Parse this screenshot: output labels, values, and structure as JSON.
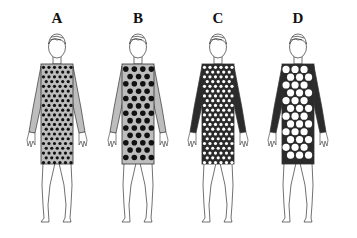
{
  "figures": [
    {
      "label": "A",
      "sleeve_color": "#bdbdbd",
      "dress_color": "#bdbdbd",
      "dot_color": "#111111",
      "dot_size": "small",
      "dot_radius": 1.6,
      "dot_spacing": 5.5,
      "center_x": 57
    },
    {
      "label": "B",
      "sleeve_color": "#bdbdbd",
      "dress_color": "#bdbdbd",
      "dot_color": "#111111",
      "dot_size": "large",
      "dot_radius": 2.8,
      "dot_spacing": 8.5,
      "center_x": 138
    },
    {
      "label": "C",
      "sleeve_color": "#2b2b2b",
      "dress_color": "#2b2b2b",
      "dot_color": "#ffffff",
      "dot_size": "small",
      "dot_radius": 1.6,
      "dot_spacing": 5.5,
      "center_x": 218
    },
    {
      "label": "D",
      "sleeve_color": "#2b2b2b",
      "dress_color": "#2b2b2b",
      "dot_color": "#ffffff",
      "dot_size": "large",
      "dot_radius": 3.6,
      "dot_spacing": 9,
      "center_x": 298
    }
  ]
}
